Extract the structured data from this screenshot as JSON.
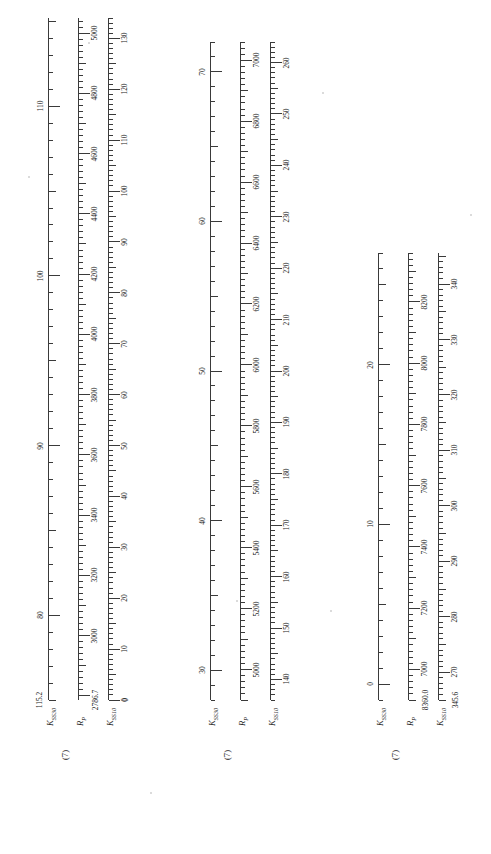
{
  "figure": {
    "kind": "nomogram",
    "background_color": "#ffffff",
    "ink_color": "#3a3a3a",
    "panel_tag": "(7)"
  },
  "axis_names": {
    "left": "K",
    "left_sub": "SS30",
    "middle": "R",
    "middle_sub": "P",
    "right": "K",
    "right_sub": "SS10"
  },
  "groups": [
    {
      "id": "group-1",
      "tag": "(7)",
      "axes": [
        {
          "id": "k-ss30",
          "name": "K",
          "sub": "SS30",
          "end_value": "115.2",
          "direction": "descending",
          "min": 75,
          "max": 115.2,
          "major_labels": [
            "80",
            "90",
            "100",
            "110"
          ],
          "major_values": [
            80,
            90,
            100,
            110
          ],
          "major_step": 10,
          "minor_step": 1
        },
        {
          "id": "r-p",
          "name": "R",
          "sub": "P",
          "end_value": "2786.7",
          "direction": "ascending",
          "min": 2786.7,
          "max": 5050,
          "major_labels": [
            "3000",
            "3200",
            "3400",
            "3600",
            "3800",
            "4000",
            "4200",
            "4400",
            "4600",
            "4800",
            "5000"
          ],
          "major_values": [
            3000,
            3200,
            3400,
            3600,
            3800,
            4000,
            4200,
            4400,
            4600,
            4800,
            5000
          ],
          "major_step": 200,
          "minor_step": 20
        },
        {
          "id": "k-ss10",
          "name": "K",
          "sub": "SS10",
          "end_value": "0",
          "direction": "ascending",
          "min": 0,
          "max": 134,
          "major_labels": [
            "0",
            "10",
            "20",
            "30",
            "40",
            "50",
            "60",
            "70",
            "80",
            "90",
            "100",
            "110",
            "120",
            "130"
          ],
          "major_values": [
            0,
            10,
            20,
            30,
            40,
            50,
            60,
            70,
            80,
            90,
            100,
            110,
            120,
            130
          ],
          "major_step": 10,
          "minor_step": 1
        }
      ]
    },
    {
      "id": "group-2",
      "tag": "(7)",
      "axes": [
        {
          "id": "k-ss30",
          "name": "K",
          "sub": "SS30",
          "end_value": "",
          "direction": "descending",
          "min": 28,
          "max": 72,
          "major_labels": [
            "30",
            "40",
            "50",
            "60",
            "70"
          ],
          "major_values": [
            30,
            40,
            50,
            60,
            70
          ],
          "major_step": 10,
          "minor_step": 1
        },
        {
          "id": "r-p",
          "name": "R",
          "sub": "P",
          "end_value": "",
          "direction": "ascending",
          "min": 4900,
          "max": 7060,
          "major_labels": [
            "5000",
            "5200",
            "5400",
            "5600",
            "5800",
            "6000",
            "6200",
            "6400",
            "6600",
            "6800",
            "7000"
          ],
          "major_values": [
            5000,
            5200,
            5400,
            5600,
            5800,
            6000,
            6200,
            6400,
            6600,
            6800,
            7000
          ],
          "major_step": 200,
          "minor_step": 20
        },
        {
          "id": "k-ss10",
          "name": "K",
          "sub": "SS10",
          "end_value": "",
          "direction": "ascending",
          "min": 136,
          "max": 264,
          "major_labels": [
            "140",
            "150",
            "160",
            "170",
            "180",
            "190",
            "200",
            "210",
            "220",
            "230",
            "240",
            "250",
            "260"
          ],
          "major_values": [
            140,
            150,
            160,
            170,
            180,
            190,
            200,
            210,
            220,
            230,
            240,
            250,
            260
          ],
          "major_step": 10,
          "minor_step": 1
        }
      ]
    },
    {
      "id": "group-3",
      "tag": "(7)",
      "axes": [
        {
          "id": "k-ss30",
          "name": "K",
          "sub": "SS30",
          "end_value": "",
          "direction": "descending",
          "min": -1,
          "max": 27,
          "major_labels": [
            "0",
            "10",
            "20"
          ],
          "major_values": [
            0,
            10,
            20
          ],
          "major_step": 10,
          "minor_step": 1
        },
        {
          "id": "r-p",
          "name": "R",
          "sub": "P",
          "end_value": "8360.0",
          "direction": "ascending",
          "min": 6900,
          "max": 8360,
          "major_labels": [
            "7000",
            "7200",
            "7400",
            "7600",
            "7800",
            "8000",
            "8200"
          ],
          "major_values": [
            7000,
            7200,
            7400,
            7600,
            7800,
            8000,
            8200
          ],
          "major_step": 200,
          "minor_step": 20
        },
        {
          "id": "k-ss10",
          "name": "K",
          "sub": "SS10",
          "end_value": "345.6",
          "direction": "ascending",
          "min": 265,
          "max": 345.6,
          "major_labels": [
            "270",
            "280",
            "290",
            "300",
            "310",
            "320",
            "330",
            "340"
          ],
          "major_values": [
            270,
            280,
            290,
            300,
            310,
            320,
            330,
            340
          ],
          "major_step": 10,
          "minor_step": 1
        }
      ]
    }
  ]
}
